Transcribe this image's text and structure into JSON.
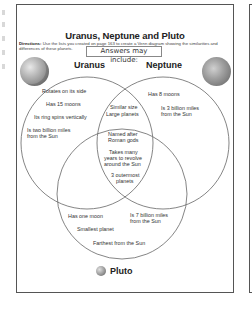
{
  "worksheet": {
    "title": "Uranus, Neptune and Pluto",
    "directions_label": "Directions:",
    "directions_text": "Use the lists you created on page 163 to create a Venn diagram showing the similarities and differences of these planets.",
    "answers_overlay": "Answers may include:"
  },
  "circles": {
    "uranus": {
      "label": "Uranus",
      "items": [
        "Rotates on its side",
        "Has 15 moons",
        "Its ring spins vertically",
        "Is two billion miles",
        "from the Sun"
      ]
    },
    "neptune": {
      "label": "Neptune",
      "items": [
        "Has 8 moons",
        "Is 3 billion miles",
        "from the Sun"
      ]
    },
    "pluto": {
      "label": "Pluto",
      "items": [
        "Has one moon",
        "Smallest planet",
        "Farthest from the Sun",
        "Is 7 billion miles",
        "from the Sun"
      ]
    },
    "uranus_neptune": {
      "items": [
        "Similar size",
        "Large planets"
      ]
    },
    "all_three": {
      "items": [
        "Named after",
        "Roman gods",
        "Takes many",
        "years to revolve",
        "around the Sun",
        "3 outermost",
        "planets"
      ]
    }
  },
  "colors": {
    "border": "#555555",
    "line": "#666666",
    "text": "#333333"
  }
}
